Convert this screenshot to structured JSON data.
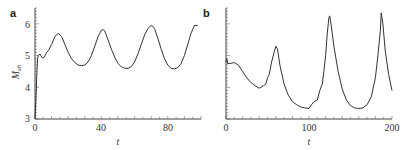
{
  "chart_data": [
    {
      "panel": "a",
      "type": "line",
      "title": "",
      "xlabel": "t",
      "ylabel": "M_sh",
      "xlim": [
        0,
        100
      ],
      "ylim": [
        3,
        6.5
      ],
      "xticks": [
        0,
        40,
        80
      ],
      "yticks": [
        3,
        4,
        5,
        6
      ],
      "grid": false,
      "series": [
        {
          "name": "M_sh",
          "x": [
            0,
            0.5,
            1,
            1.5,
            2,
            3,
            4,
            5,
            6,
            7,
            8,
            10,
            12,
            14,
            16,
            18,
            20,
            22,
            24,
            26,
            28,
            30,
            32,
            34,
            36,
            38,
            40,
            41,
            42,
            44,
            46,
            48,
            50,
            52,
            54,
            56,
            58,
            60,
            62,
            64,
            66,
            68,
            70,
            71,
            72,
            74,
            76,
            78,
            80,
            82,
            84,
            86,
            88,
            90,
            92,
            94,
            96,
            98
          ],
          "y": [
            3.0,
            3.5,
            4.3,
            4.9,
            5.0,
            5.05,
            4.95,
            4.92,
            5.0,
            5.1,
            5.15,
            5.35,
            5.6,
            5.7,
            5.6,
            5.35,
            5.1,
            4.9,
            4.78,
            4.7,
            4.68,
            4.7,
            4.8,
            5.0,
            5.3,
            5.6,
            5.8,
            5.82,
            5.78,
            5.5,
            5.2,
            4.95,
            4.75,
            4.65,
            4.6,
            4.6,
            4.65,
            4.8,
            5.05,
            5.35,
            5.65,
            5.85,
            5.95,
            5.92,
            5.85,
            5.55,
            5.2,
            4.9,
            4.7,
            4.6,
            4.58,
            4.62,
            4.75,
            5.0,
            5.35,
            5.7,
            5.95,
            5.95
          ]
        }
      ]
    },
    {
      "panel": "b",
      "type": "line",
      "title": "",
      "xlabel": "t",
      "ylabel": "",
      "xlim": [
        0,
        200
      ],
      "ylim": [
        3,
        6.5
      ],
      "xticks": [
        0,
        100,
        200
      ],
      "yticks": [],
      "grid": false,
      "series": [
        {
          "name": "M_sh",
          "x": [
            0,
            1,
            2,
            5,
            10,
            15,
            20,
            25,
            30,
            35,
            40,
            45,
            48,
            50,
            52,
            55,
            58,
            60,
            62,
            65,
            70,
            75,
            80,
            85,
            90,
            95,
            100,
            103,
            106,
            110,
            113,
            116,
            118,
            120,
            122,
            124,
            125,
            127,
            130,
            135,
            140,
            145,
            150,
            155,
            160,
            165,
            170,
            175,
            180,
            183,
            186,
            187,
            189,
            192,
            196,
            200
          ],
          "y": [
            4.8,
            4.9,
            4.75,
            4.75,
            4.78,
            4.7,
            4.5,
            4.3,
            4.15,
            4.05,
            3.97,
            4.05,
            4.1,
            4.3,
            4.4,
            4.8,
            5.1,
            5.3,
            5.2,
            4.7,
            4.1,
            3.75,
            3.55,
            3.45,
            3.38,
            3.35,
            3.33,
            3.45,
            3.55,
            3.6,
            3.9,
            4.1,
            4.5,
            5.0,
            5.7,
            6.2,
            6.25,
            5.9,
            5.3,
            4.5,
            3.95,
            3.6,
            3.42,
            3.35,
            3.33,
            3.35,
            3.45,
            3.7,
            4.3,
            5.0,
            5.8,
            6.35,
            6.0,
            5.1,
            4.4,
            3.9
          ]
        }
      ]
    }
  ],
  "labels": {
    "panel_a": "a",
    "panel_b": "b",
    "ylabel_a_main": "M",
    "ylabel_a_sub": "sh",
    "xlabel_a": "t",
    "xlabel_b": "t",
    "a_xticks": [
      "0",
      "40",
      "80"
    ],
    "a_yticks": [
      "3",
      "4",
      "5",
      "6"
    ],
    "b_xticks": [
      "0",
      "100",
      "200"
    ]
  }
}
